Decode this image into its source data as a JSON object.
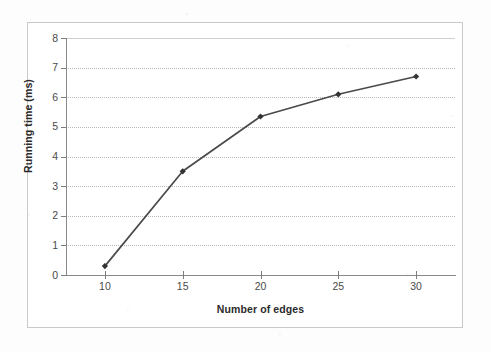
{
  "chart_data": {
    "type": "line",
    "title": "",
    "xlabel": "Number of edges",
    "ylabel": "Running time (ms)",
    "x": [
      10,
      15,
      20,
      25,
      30
    ],
    "values": [
      0.3,
      3.5,
      5.35,
      6.1,
      6.7
    ],
    "series": [
      {
        "name": "Running time",
        "x": [
          10,
          15,
          20,
          25,
          30
        ],
        "values": [
          0.3,
          3.5,
          5.35,
          6.1,
          6.7
        ]
      }
    ],
    "xlim": [
      7.5,
      32.5
    ],
    "ylim": [
      0,
      8
    ],
    "x_ticks": [
      "10",
      "15",
      "20",
      "25",
      "30"
    ],
    "y_ticks": [
      "0",
      "1",
      "2",
      "3",
      "4",
      "5",
      "6",
      "7",
      "8"
    ],
    "grid": "horizontal-dotted",
    "legend": "none",
    "marker": "diamond",
    "line_color": "#4a4a4a",
    "marker_color": "#333333",
    "grid_color": "#b9b9b9",
    "axis_color": "#8a8a8a",
    "plot_background": "#ffffff"
  },
  "axes": {
    "y_title": "Running time (ms)",
    "x_title": "Number of edges"
  }
}
